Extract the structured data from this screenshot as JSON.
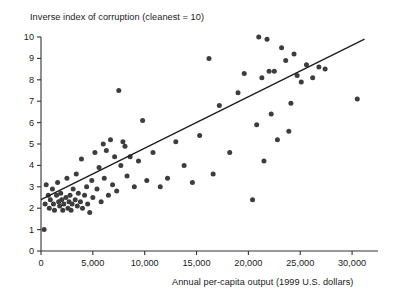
{
  "chart_data": {
    "type": "scatter",
    "title": "Inverse index of corruption (cleanest = 10)",
    "xlabel": "Annual per-capita output (1999 U.S. dollars)",
    "ylabel": "Inverse index of corruption (cleanest = 10)",
    "xlim": [
      0,
      32500
    ],
    "ylim": [
      0,
      10
    ],
    "grid": false,
    "legend": null,
    "xticks": [
      0,
      5000,
      10000,
      15000,
      20000,
      25000,
      30000
    ],
    "xtick_labels": [
      "0",
      "5,000",
      "10,000",
      "15,000",
      "20,000",
      "25,000",
      "30,000"
    ],
    "yticks": [
      0,
      1,
      2,
      3,
      4,
      5,
      6,
      7,
      8,
      9,
      10
    ],
    "ytick_labels": [
      "0",
      "1",
      "2",
      "3",
      "4",
      "5",
      "6",
      "7",
      "8",
      "9",
      "10"
    ],
    "marker_color": "#3d3d3d",
    "marker_size": 5,
    "trend_line": {
      "label": "linear fit",
      "color": "#1a1a1a",
      "x_start": 0,
      "y_start": 2.4,
      "x_end": 31200,
      "y_end": 9.9
    },
    "points": [
      [
        300,
        1.0
      ],
      [
        400,
        2.2
      ],
      [
        500,
        3.1
      ],
      [
        700,
        2.6
      ],
      [
        800,
        2.0
      ],
      [
        900,
        2.4
      ],
      [
        1100,
        2.9
      ],
      [
        1200,
        2.2
      ],
      [
        1300,
        1.9
      ],
      [
        1500,
        2.6
      ],
      [
        1600,
        3.2
      ],
      [
        1700,
        2.3
      ],
      [
        1800,
        2.1
      ],
      [
        1900,
        2.7
      ],
      [
        2000,
        2.4
      ],
      [
        2100,
        1.9
      ],
      [
        2200,
        2.2
      ],
      [
        2400,
        2.5
      ],
      [
        2500,
        3.4
      ],
      [
        2600,
        2.0
      ],
      [
        2700,
        2.3
      ],
      [
        2800,
        2.6
      ],
      [
        2900,
        1.9
      ],
      [
        3000,
        2.2
      ],
      [
        3100,
        2.9
      ],
      [
        3300,
        2.4
      ],
      [
        3400,
        3.6
      ],
      [
        3500,
        2.1
      ],
      [
        3600,
        2.7
      ],
      [
        3800,
        2.3
      ],
      [
        3900,
        4.3
      ],
      [
        4000,
        2.0
      ],
      [
        4200,
        2.6
      ],
      [
        4400,
        3.0
      ],
      [
        4500,
        2.2
      ],
      [
        4700,
        1.8
      ],
      [
        4900,
        3.3
      ],
      [
        5000,
        2.5
      ],
      [
        5200,
        4.6
      ],
      [
        5400,
        2.9
      ],
      [
        5600,
        3.9
      ],
      [
        5800,
        2.3
      ],
      [
        6000,
        5.0
      ],
      [
        6100,
        3.4
      ],
      [
        6300,
        4.7
      ],
      [
        6500,
        2.6
      ],
      [
        6700,
        5.2
      ],
      [
        6900,
        3.1
      ],
      [
        7100,
        4.4
      ],
      [
        7300,
        2.8
      ],
      [
        7500,
        7.5
      ],
      [
        7700,
        4.0
      ],
      [
        7900,
        5.1
      ],
      [
        8100,
        4.9
      ],
      [
        8300,
        3.5
      ],
      [
        8600,
        4.4
      ],
      [
        9000,
        3.0
      ],
      [
        9400,
        4.2
      ],
      [
        9800,
        6.1
      ],
      [
        10200,
        3.3
      ],
      [
        10800,
        4.6
      ],
      [
        11500,
        3.0
      ],
      [
        12200,
        3.4
      ],
      [
        13000,
        5.1
      ],
      [
        13800,
        4.0
      ],
      [
        14600,
        3.2
      ],
      [
        15300,
        5.4
      ],
      [
        16200,
        9.0
      ],
      [
        16600,
        3.6
      ],
      [
        17200,
        6.8
      ],
      [
        18200,
        4.6
      ],
      [
        19000,
        7.4
      ],
      [
        19600,
        8.3
      ],
      [
        20400,
        2.4
      ],
      [
        20800,
        5.9
      ],
      [
        21000,
        10.0
      ],
      [
        21300,
        8.1
      ],
      [
        21500,
        4.2
      ],
      [
        21800,
        9.9
      ],
      [
        22000,
        8.4
      ],
      [
        22200,
        6.4
      ],
      [
        22500,
        8.4
      ],
      [
        22800,
        5.2
      ],
      [
        23200,
        9.5
      ],
      [
        23600,
        8.9
      ],
      [
        23900,
        5.6
      ],
      [
        24100,
        6.9
      ],
      [
        24400,
        9.2
      ],
      [
        24700,
        8.2
      ],
      [
        25100,
        7.9
      ],
      [
        25600,
        8.7
      ],
      [
        26200,
        8.1
      ],
      [
        26800,
        8.6
      ],
      [
        27400,
        8.5
      ],
      [
        30500,
        7.1
      ]
    ]
  }
}
